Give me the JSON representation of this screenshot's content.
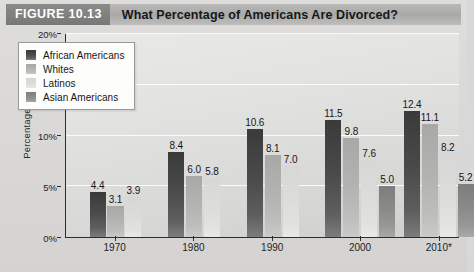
{
  "header": {
    "figure_tag": "FIGURE 10.13",
    "title": "What Percentage of Americans Are Divorced?"
  },
  "chart_data": {
    "type": "bar",
    "title": "What Percentage of Americans Are Divorced?",
    "xlabel": "",
    "ylabel": "Percentage",
    "ylim": [
      0,
      20
    ],
    "yticks": [
      "0%",
      "5%",
      "10%",
      "15%",
      "20%"
    ],
    "ytick_values": [
      0,
      5,
      10,
      15,
      20
    ],
    "grid": true,
    "legend_position": "top-left",
    "categories": [
      "1970",
      "1980",
      "1990",
      "2000",
      "2010*"
    ],
    "series": [
      {
        "name": "African Americans",
        "color": "#4a4a4a",
        "values": [
          4.4,
          8.4,
          10.6,
          11.5,
          12.4
        ],
        "labels": [
          "4.4",
          "8.4",
          "10.6",
          "11.5",
          "12.4"
        ]
      },
      {
        "name": "Whites",
        "color": "#b2b2b0",
        "values": [
          3.1,
          6.0,
          8.1,
          9.8,
          11.1
        ],
        "labels": [
          "3.1",
          "6.0",
          "8.1",
          "9.8",
          "11.1"
        ]
      },
      {
        "name": "Latinos",
        "color": "#dcdcda",
        "values": [
          3.9,
          5.8,
          7.0,
          7.6,
          8.2
        ],
        "labels": [
          "3.9",
          "5.8",
          "7.0",
          "7.6",
          "8.2"
        ]
      },
      {
        "name": "Asian Americans",
        "color": "#8a8a88",
        "values": [
          null,
          null,
          null,
          5.0,
          5.2
        ],
        "labels": [
          null,
          null,
          null,
          "5.0",
          "5.2"
        ]
      }
    ]
  }
}
